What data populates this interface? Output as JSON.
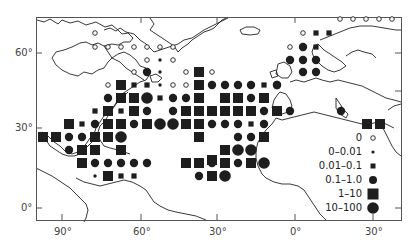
{
  "figure": {
    "type": "proportional-symbol map",
    "region": "North Atlantic Ocean with Europe, North Africa, North/Central/South America coastlines"
  },
  "axes": {
    "latitude_ticks": [
      {
        "label": "60°",
        "y": 53
      },
      {
        "label": "30°",
        "y": 128
      },
      {
        "label": "0°",
        "y": 208
      }
    ],
    "longitude_ticks": [
      {
        "label": "90°",
        "x": 62
      },
      {
        "label": "60°",
        "x": 141
      },
      {
        "label": "30°",
        "x": 217
      },
      {
        "label": "0°",
        "x": 295
      },
      {
        "label": "30°",
        "x": 373
      }
    ]
  },
  "legend": {
    "entries": [
      {
        "label": "0",
        "symbol": "open-circle-small"
      },
      {
        "label": "0–0.01",
        "symbol": "dot-tiny"
      },
      {
        "label": "0.01–0.1",
        "symbol": "square-small"
      },
      {
        "label": "0.1–1.0",
        "symbol": "circle-medium"
      },
      {
        "label": "1–10",
        "symbol": "square-large"
      },
      {
        "label": "10–100",
        "symbol": "circle-large"
      }
    ]
  },
  "colors": {
    "ink": "#1e1e1e",
    "frame": "#555555",
    "coast": "#222222",
    "background": "#ffffff"
  },
  "markers": [
    {
      "x": 95,
      "y": 33,
      "t": "o"
    },
    {
      "x": 95,
      "y": 47,
      "t": "o"
    },
    {
      "x": 108,
      "y": 47,
      "t": "o"
    },
    {
      "x": 121,
      "y": 47,
      "t": "o"
    },
    {
      "x": 134,
      "y": 47,
      "t": "o"
    },
    {
      "x": 147,
      "y": 47,
      "t": "o"
    },
    {
      "x": 160,
      "y": 47,
      "t": "o"
    },
    {
      "x": 173,
      "y": 47,
      "t": "o"
    },
    {
      "x": 147,
      "y": 60,
      "t": "o"
    },
    {
      "x": 160,
      "y": 60,
      "t": "d"
    },
    {
      "x": 173,
      "y": 60,
      "t": "o"
    },
    {
      "x": 134,
      "y": 72,
      "t": "o"
    },
    {
      "x": 147,
      "y": 72,
      "t": "c"
    },
    {
      "x": 160,
      "y": 72,
      "t": "d"
    },
    {
      "x": 186,
      "y": 72,
      "t": "o"
    },
    {
      "x": 199,
      "y": 72,
      "t": "S"
    },
    {
      "x": 212,
      "y": 72,
      "t": "o"
    },
    {
      "x": 108,
      "y": 85,
      "t": "o"
    },
    {
      "x": 121,
      "y": 85,
      "t": "S"
    },
    {
      "x": 134,
      "y": 85,
      "t": "s"
    },
    {
      "x": 147,
      "y": 85,
      "t": "s"
    },
    {
      "x": 160,
      "y": 85,
      "t": "d"
    },
    {
      "x": 173,
      "y": 85,
      "t": "o"
    },
    {
      "x": 186,
      "y": 85,
      "t": "o"
    },
    {
      "x": 199,
      "y": 85,
      "t": "S"
    },
    {
      "x": 212,
      "y": 85,
      "t": "c"
    },
    {
      "x": 225,
      "y": 85,
      "t": "c"
    },
    {
      "x": 238,
      "y": 85,
      "t": "c"
    },
    {
      "x": 251,
      "y": 85,
      "t": "c"
    },
    {
      "x": 264,
      "y": 85,
      "t": "s"
    },
    {
      "x": 277,
      "y": 85,
      "t": "c"
    },
    {
      "x": 108,
      "y": 98,
      "t": "c"
    },
    {
      "x": 121,
      "y": 98,
      "t": "S"
    },
    {
      "x": 134,
      "y": 98,
      "t": "S"
    },
    {
      "x": 147,
      "y": 98,
      "t": "C"
    },
    {
      "x": 160,
      "y": 98,
      "t": "s"
    },
    {
      "x": 173,
      "y": 98,
      "t": "c"
    },
    {
      "x": 186,
      "y": 98,
      "t": "c"
    },
    {
      "x": 199,
      "y": 98,
      "t": "S"
    },
    {
      "x": 225,
      "y": 98,
      "t": "S"
    },
    {
      "x": 238,
      "y": 98,
      "t": "S"
    },
    {
      "x": 251,
      "y": 98,
      "t": "c"
    },
    {
      "x": 264,
      "y": 98,
      "t": "S"
    },
    {
      "x": 95,
      "y": 111,
      "t": "s"
    },
    {
      "x": 108,
      "y": 111,
      "t": "S"
    },
    {
      "x": 121,
      "y": 111,
      "t": "s"
    },
    {
      "x": 134,
      "y": 111,
      "t": "S"
    },
    {
      "x": 147,
      "y": 111,
      "t": "c"
    },
    {
      "x": 173,
      "y": 111,
      "t": "c"
    },
    {
      "x": 186,
      "y": 111,
      "t": "S"
    },
    {
      "x": 199,
      "y": 111,
      "t": "S"
    },
    {
      "x": 212,
      "y": 111,
      "t": "S"
    },
    {
      "x": 225,
      "y": 111,
      "t": "S"
    },
    {
      "x": 238,
      "y": 111,
      "t": "S"
    },
    {
      "x": 251,
      "y": 111,
      "t": "S"
    },
    {
      "x": 264,
      "y": 111,
      "t": "c"
    },
    {
      "x": 277,
      "y": 111,
      "t": "S"
    },
    {
      "x": 69,
      "y": 124,
      "t": "S"
    },
    {
      "x": 82,
      "y": 124,
      "t": "s"
    },
    {
      "x": 95,
      "y": 124,
      "t": "c"
    },
    {
      "x": 108,
      "y": 124,
      "t": "S"
    },
    {
      "x": 121,
      "y": 124,
      "t": "S"
    },
    {
      "x": 134,
      "y": 124,
      "t": "c"
    },
    {
      "x": 147,
      "y": 124,
      "t": "S"
    },
    {
      "x": 160,
      "y": 124,
      "t": "C"
    },
    {
      "x": 173,
      "y": 124,
      "t": "C"
    },
    {
      "x": 186,
      "y": 124,
      "t": "S"
    },
    {
      "x": 199,
      "y": 124,
      "t": "S"
    },
    {
      "x": 212,
      "y": 124,
      "t": "c"
    },
    {
      "x": 225,
      "y": 124,
      "t": "c"
    },
    {
      "x": 238,
      "y": 124,
      "t": "c"
    },
    {
      "x": 251,
      "y": 124,
      "t": "s"
    },
    {
      "x": 264,
      "y": 124,
      "t": "c"
    },
    {
      "x": 43,
      "y": 137,
      "t": "S"
    },
    {
      "x": 56,
      "y": 137,
      "t": "S"
    },
    {
      "x": 69,
      "y": 137,
      "t": "c"
    },
    {
      "x": 82,
      "y": 137,
      "t": "c"
    },
    {
      "x": 95,
      "y": 137,
      "t": "S"
    },
    {
      "x": 108,
      "y": 137,
      "t": "S"
    },
    {
      "x": 121,
      "y": 137,
      "t": "C"
    },
    {
      "x": 199,
      "y": 137,
      "t": "S"
    },
    {
      "x": 238,
      "y": 137,
      "t": "c"
    },
    {
      "x": 251,
      "y": 137,
      "t": "c"
    },
    {
      "x": 264,
      "y": 137,
      "t": "S"
    },
    {
      "x": 69,
      "y": 150,
      "t": "c"
    },
    {
      "x": 82,
      "y": 150,
      "t": "S"
    },
    {
      "x": 95,
      "y": 150,
      "t": "S"
    },
    {
      "x": 121,
      "y": 150,
      "t": "S"
    },
    {
      "x": 225,
      "y": 150,
      "t": "S"
    },
    {
      "x": 238,
      "y": 150,
      "t": "C"
    },
    {
      "x": 251,
      "y": 150,
      "t": "C"
    },
    {
      "x": 82,
      "y": 163,
      "t": "S"
    },
    {
      "x": 95,
      "y": 163,
      "t": "c"
    },
    {
      "x": 108,
      "y": 163,
      "t": "c"
    },
    {
      "x": 121,
      "y": 163,
      "t": "c"
    },
    {
      "x": 134,
      "y": 163,
      "t": "c"
    },
    {
      "x": 147,
      "y": 163,
      "t": "c"
    },
    {
      "x": 186,
      "y": 163,
      "t": "S"
    },
    {
      "x": 199,
      "y": 163,
      "t": "S"
    },
    {
      "x": 212,
      "y": 163,
      "t": "c"
    },
    {
      "x": 225,
      "y": 163,
      "t": "c"
    },
    {
      "x": 238,
      "y": 163,
      "t": "c"
    },
    {
      "x": 251,
      "y": 163,
      "t": "S"
    },
    {
      "x": 264,
      "y": 163,
      "t": "C"
    },
    {
      "x": 95,
      "y": 176,
      "t": "d"
    },
    {
      "x": 108,
      "y": 176,
      "t": "S"
    },
    {
      "x": 121,
      "y": 176,
      "t": "s"
    },
    {
      "x": 134,
      "y": 176,
      "t": "s"
    },
    {
      "x": 199,
      "y": 176,
      "t": "c"
    },
    {
      "x": 212,
      "y": 176,
      "t": "S"
    },
    {
      "x": 225,
      "y": 176,
      "t": "C"
    },
    {
      "x": 212,
      "y": 160,
      "t": "S"
    },
    {
      "x": 225,
      "y": 163,
      "t": "S"
    },
    {
      "x": 340,
      "y": 19,
      "t": "o"
    },
    {
      "x": 353,
      "y": 19,
      "t": "o"
    },
    {
      "x": 366,
      "y": 19,
      "t": "o"
    },
    {
      "x": 379,
      "y": 19,
      "t": "o"
    },
    {
      "x": 392,
      "y": 19,
      "t": "o"
    },
    {
      "x": 303,
      "y": 33,
      "t": "o"
    },
    {
      "x": 316,
      "y": 33,
      "t": "s"
    },
    {
      "x": 329,
      "y": 33,
      "t": "s"
    },
    {
      "x": 290,
      "y": 47,
      "t": "o"
    },
    {
      "x": 303,
      "y": 47,
      "t": "c"
    },
    {
      "x": 316,
      "y": 47,
      "t": "s"
    },
    {
      "x": 290,
      "y": 60,
      "t": "c"
    },
    {
      "x": 303,
      "y": 60,
      "t": "c"
    },
    {
      "x": 316,
      "y": 60,
      "t": "c"
    },
    {
      "x": 303,
      "y": 72,
      "t": "c"
    },
    {
      "x": 316,
      "y": 72,
      "t": "c"
    },
    {
      "x": 277,
      "y": 85,
      "t": "c"
    },
    {
      "x": 290,
      "y": 111,
      "t": "c"
    },
    {
      "x": 341,
      "y": 111,
      "t": "c"
    },
    {
      "x": 367,
      "y": 124,
      "t": "S"
    },
    {
      "x": 380,
      "y": 124,
      "t": "S"
    }
  ]
}
